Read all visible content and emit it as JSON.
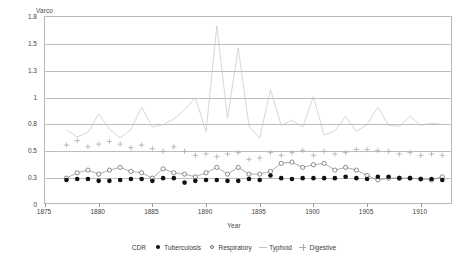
{
  "chart_data": {
    "type": "line",
    "title": "",
    "ylabel": "Varco",
    "xlabel": "Year",
    "grid": true,
    "legend_position": "bottom",
    "legend_title": "CDR",
    "ytick_labels": [
      "0",
      "0.3",
      "0.5",
      "0.8",
      "1",
      "1.3",
      "1.5",
      "1.8"
    ],
    "ytick_values": [
      0,
      0.3,
      0.5,
      0.8,
      1,
      1.3,
      1.5,
      1.8
    ],
    "xtick_labels": [
      "1875",
      "1880",
      "1885",
      "1890",
      "1895",
      "1900",
      "1905",
      "1910"
    ],
    "xtick_values": [
      1875,
      1880,
      1885,
      1890,
      1895,
      1900,
      1905,
      1910
    ],
    "xlim": [
      1875,
      1913
    ],
    "ylim": [
      0,
      1.8
    ],
    "x": [
      1877,
      1878,
      1879,
      1880,
      1881,
      1882,
      1883,
      1884,
      1885,
      1886,
      1887,
      1888,
      1889,
      1890,
      1891,
      1892,
      1893,
      1894,
      1895,
      1896,
      1897,
      1898,
      1899,
      1900,
      1901,
      1902,
      1903,
      1904,
      1905,
      1906,
      1907,
      1908,
      1909,
      1910,
      1911,
      1912
    ],
    "series": [
      {
        "name": "Tuberculosis",
        "marker": "filled-circle",
        "color": "#111111",
        "values": [
          0.28,
          0.29,
          0.29,
          0.27,
          0.27,
          0.28,
          0.29,
          0.29,
          0.27,
          0.3,
          0.3,
          0.25,
          0.27,
          0.28,
          0.28,
          0.27,
          0.27,
          0.29,
          0.28,
          0.32,
          0.3,
          0.29,
          0.3,
          0.3,
          0.3,
          0.3,
          0.31,
          0.3,
          0.29,
          0.31,
          0.31,
          0.3,
          0.3,
          0.29,
          0.29,
          0.28
        ]
      },
      {
        "name": "Respiratory",
        "marker": "open-circle",
        "color": "#777777",
        "values": [
          0.3,
          0.34,
          0.36,
          0.33,
          0.36,
          0.38,
          0.35,
          0.34,
          0.3,
          0.37,
          0.34,
          0.33,
          0.31,
          0.34,
          0.38,
          0.33,
          0.38,
          0.33,
          0.33,
          0.35,
          0.41,
          0.42,
          0.38,
          0.4,
          0.41,
          0.36,
          0.38,
          0.36,
          0.32,
          0.28,
          0.3,
          0.3,
          0.3,
          0.29,
          0.28,
          0.31
        ]
      },
      {
        "name": "Typhoid",
        "marker": "none",
        "color": "#c4c4c4",
        "values": [
          0.74,
          0.66,
          0.71,
          0.88,
          0.75,
          0.65,
          0.74,
          0.93,
          0.77,
          0.8,
          0.84,
          0.91,
          1.0,
          0.72,
          1.7,
          0.85,
          1.47,
          0.78,
          0.65,
          1.09,
          0.79,
          0.83,
          0.77,
          1.01,
          0.68,
          0.73,
          0.86,
          0.72,
          0.8,
          0.93,
          0.79,
          0.78,
          0.86,
          0.79,
          0.81,
          0.8
        ]
      },
      {
        "name": "Digestive",
        "marker": "plus",
        "color": "#a8a8a8",
        "values": [
          0.57,
          0.62,
          0.55,
          0.58,
          0.61,
          0.58,
          0.54,
          0.57,
          0.53,
          0.5,
          0.55,
          0.5,
          0.47,
          0.48,
          0.46,
          0.48,
          0.49,
          0.44,
          0.45,
          0.49,
          0.47,
          0.49,
          0.51,
          0.47,
          0.5,
          0.48,
          0.49,
          0.52,
          0.52,
          0.51,
          0.5,
          0.48,
          0.49,
          0.47,
          0.48,
          0.47
        ]
      }
    ]
  }
}
